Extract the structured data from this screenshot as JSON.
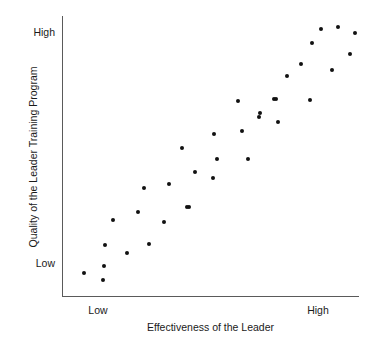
{
  "chart_data": {
    "type": "scatter",
    "title": "",
    "xlabel": "Effectiveness of the Leader",
    "ylabel": "Quality of the Leader Training Program",
    "x_tick_labels": [
      "Low",
      "High"
    ],
    "y_tick_labels": [
      "Low",
      "High"
    ],
    "x_tick_positions_px": [
      97,
      318
    ],
    "y_tick_positions_px": [
      264,
      33
    ],
    "grid": false,
    "legend": null,
    "axis_color": "#5a5a5a",
    "point_color": "#111111",
    "background_color": "#ffffff",
    "point_count": 35,
    "relationship": "positive linear correlation",
    "points_px": [
      [
        84,
        273
      ],
      [
        103,
        280
      ],
      [
        104,
        266
      ],
      [
        105,
        245
      ],
      [
        113,
        220
      ],
      [
        127,
        253
      ],
      [
        138,
        212
      ],
      [
        144,
        188
      ],
      [
        149,
        244
      ],
      [
        164,
        222
      ],
      [
        169,
        184
      ],
      [
        189,
        207
      ],
      [
        195,
        172
      ],
      [
        214,
        134
      ],
      [
        213,
        178
      ],
      [
        217,
        159
      ],
      [
        238,
        101
      ],
      [
        242,
        131
      ],
      [
        248,
        159
      ],
      [
        259,
        117
      ],
      [
        260,
        113
      ],
      [
        274,
        99
      ],
      [
        276,
        99
      ],
      [
        278,
        122
      ],
      [
        287,
        76
      ],
      [
        301,
        64
      ],
      [
        310,
        100
      ],
      [
        312,
        43
      ],
      [
        321,
        29
      ],
      [
        332,
        70
      ],
      [
        338,
        27
      ],
      [
        350,
        54
      ],
      [
        355,
        33
      ],
      [
        182,
        148
      ],
      [
        187,
        207
      ]
    ]
  },
  "axis": {
    "y_high_label": "High",
    "y_low_label": "Low",
    "x_low_label": "Low",
    "x_high_label": "High",
    "x_title": "Effectiveness of the Leader",
    "y_title": "Quality of the Leader Training Program"
  }
}
